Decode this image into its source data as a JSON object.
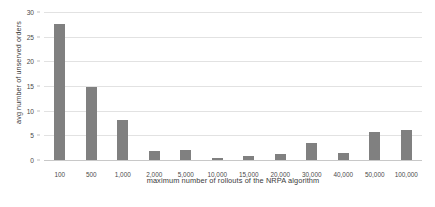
{
  "chart_data": {
    "type": "bar",
    "title": "",
    "xlabel": "maximum number of rollouts of the NRPA algorithm",
    "ylabel": "avg number of unserved orders",
    "categories": [
      "100",
      "500",
      "1,000",
      "2,000",
      "5,000",
      "10,000",
      "15,000",
      "20,000",
      "30,000",
      "40,000",
      "50,000",
      "100,000"
    ],
    "values": [
      27.5,
      14.7,
      8.1,
      1.8,
      2.1,
      0.5,
      0.8,
      1.2,
      3.5,
      1.4,
      5.7,
      6.1
    ],
    "ylim": [
      0,
      30
    ],
    "yticks": [
      0,
      5,
      10,
      15,
      20,
      25,
      30
    ],
    "ytick_labels": [
      "0",
      "5",
      "10",
      "15",
      "20",
      "25",
      "30"
    ],
    "grid": true,
    "legend": false,
    "bar_color": "#808080",
    "gridline_color": "#e2e2e2",
    "background_color": "#ffffff"
  }
}
